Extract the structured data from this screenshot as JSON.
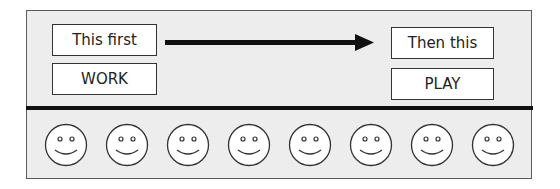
{
  "board": {
    "first": {
      "header": "This first",
      "activity": "WORK"
    },
    "then": {
      "header": "Then this",
      "activity": "PLAY"
    },
    "arrow": "right-arrow-icon",
    "tokens": {
      "count": 8,
      "icon": "smiley-face-icon"
    }
  },
  "colors": {
    "frame_bg": "#ededed",
    "stroke": "#111111",
    "box_bg": "#ffffff"
  }
}
